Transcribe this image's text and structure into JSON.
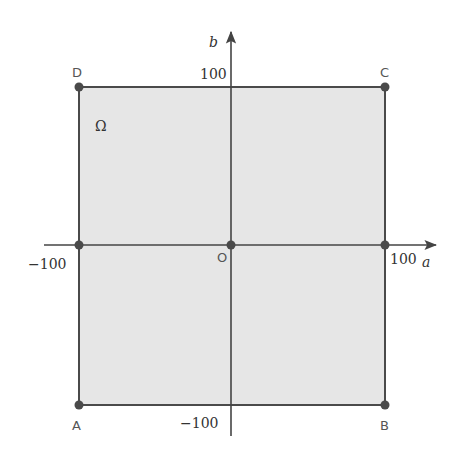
{
  "diagram": {
    "region": {
      "label": "Ω",
      "fill": "#e6e6e6",
      "stroke": "#4a4a4a"
    },
    "axes": {
      "x_label": "a",
      "y_label": "b",
      "color": "#444444"
    },
    "ticks": {
      "x_pos": "100",
      "x_neg": "−100",
      "y_pos": "100",
      "y_neg": "−100"
    },
    "points": {
      "A": {
        "label": "A",
        "coords": [
          -100,
          -100
        ]
      },
      "B": {
        "label": "B",
        "coords": [
          100,
          -100
        ]
      },
      "C": {
        "label": "C",
        "coords": [
          100,
          100
        ]
      },
      "D": {
        "label": "D",
        "coords": [
          -100,
          100
        ]
      },
      "O": {
        "label": "O",
        "coords": [
          0,
          0
        ]
      }
    },
    "point_color": "#4a4a4a"
  }
}
